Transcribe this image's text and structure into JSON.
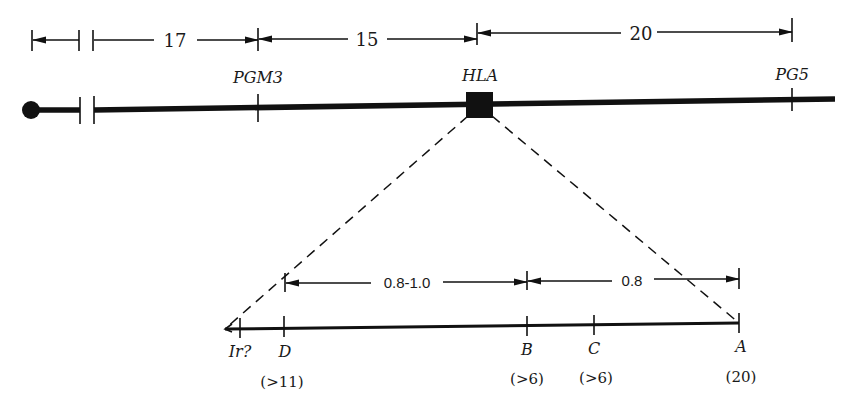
{
  "figure": {
    "type": "genetic-map",
    "colors": {
      "ink": "#111111",
      "background": "#ffffff"
    }
  },
  "top_map": {
    "distances": [
      {
        "label": "17",
        "from": "break",
        "to": "PGM3"
      },
      {
        "label": "15",
        "from": "PGM3",
        "to": "HLA"
      },
      {
        "label": "20",
        "from": "HLA",
        "to": "PG5"
      }
    ],
    "loci": [
      {
        "name": "PGM3"
      },
      {
        "name": "HLA"
      },
      {
        "name": "PG5"
      }
    ],
    "centromere": "filled-circle"
  },
  "detail_map": {
    "distances": [
      {
        "label": "0.8-1.0",
        "from": "D",
        "to": "B"
      },
      {
        "label": "0.8",
        "from": "B",
        "to": "A"
      }
    ],
    "loci": [
      {
        "name": "Ir?",
        "value": ""
      },
      {
        "name": "D",
        "value": "(>11)"
      },
      {
        "name": "B",
        "value": "(31)"
      },
      {
        "name": "C",
        "value": "(>6)"
      },
      {
        "name": "A",
        "value": "(20)"
      }
    ]
  }
}
